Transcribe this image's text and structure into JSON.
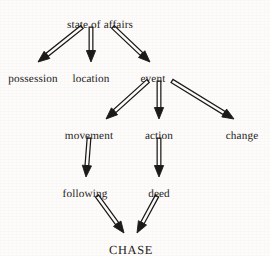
{
  "figure": {
    "type": "hierarchical-taxonomy-tree",
    "background_color": "#fdfcfb",
    "ink_color": "#1c1a18",
    "arrow_style": "outlined-double-stroke",
    "root": "state of affairs",
    "terminal": "CHASE"
  },
  "nodes": [
    {
      "id": "state-of-affairs",
      "label": "state of affairs",
      "x": 100,
      "y": 19,
      "level": 0
    },
    {
      "id": "possession",
      "label": "possession",
      "x": 33,
      "y": 73,
      "level": 1
    },
    {
      "id": "location",
      "label": "location",
      "x": 91,
      "y": 73,
      "level": 1
    },
    {
      "id": "event",
      "label": "event",
      "x": 153,
      "y": 73,
      "level": 1
    },
    {
      "id": "movement",
      "label": "movement",
      "x": 89,
      "y": 130,
      "level": 2
    },
    {
      "id": "action",
      "label": "action",
      "x": 159,
      "y": 130,
      "level": 2
    },
    {
      "id": "change",
      "label": "change",
      "x": 242,
      "y": 130,
      "level": 2
    },
    {
      "id": "following",
      "label": "following",
      "x": 85,
      "y": 188,
      "level": 3
    },
    {
      "id": "deed",
      "label": "deed",
      "x": 159,
      "y": 188,
      "level": 3
    },
    {
      "id": "chase",
      "label": "CHASE",
      "x": 131,
      "y": 244,
      "level": 4,
      "terminal": true
    }
  ],
  "edges": [
    {
      "id": "edge-soa-possession",
      "from": "state of affairs",
      "to": "possession",
      "x1": 82,
      "y1": 27,
      "x2": 38,
      "y2": 62
    },
    {
      "id": "edge-soa-location",
      "from": "state of affairs",
      "to": "location",
      "x1": 91,
      "y1": 27,
      "x2": 91,
      "y2": 62
    },
    {
      "id": "edge-soa-event",
      "from": "state of affairs",
      "to": "event",
      "x1": 113,
      "y1": 27,
      "x2": 150,
      "y2": 62
    },
    {
      "id": "edge-event-movement",
      "from": "event",
      "to": "movement",
      "x1": 148,
      "y1": 81,
      "x2": 106,
      "y2": 119
    },
    {
      "id": "edge-event-action",
      "from": "event",
      "to": "action",
      "x1": 159,
      "y1": 81,
      "x2": 159,
      "y2": 119
    },
    {
      "id": "edge-event-change",
      "from": "event",
      "to": "change",
      "x1": 172,
      "y1": 81,
      "x2": 234,
      "y2": 119
    },
    {
      "id": "edge-movement-following",
      "from": "movement",
      "to": "following",
      "x1": 89,
      "y1": 138,
      "x2": 86,
      "y2": 177
    },
    {
      "id": "edge-action-deed",
      "from": "action",
      "to": "deed",
      "x1": 159,
      "y1": 138,
      "x2": 159,
      "y2": 177
    },
    {
      "id": "edge-following-chase",
      "from": "following",
      "to": "CHASE",
      "x1": 97,
      "y1": 196,
      "x2": 124,
      "y2": 233
    },
    {
      "id": "edge-deed-chase",
      "from": "deed",
      "to": "CHASE",
      "x1": 157,
      "y1": 196,
      "x2": 137,
      "y2": 233
    }
  ],
  "chart_data": {
    "type": "tree",
    "title": "",
    "levels": [
      {
        "depth": 0,
        "labels": [
          "state of affairs"
        ]
      },
      {
        "depth": 1,
        "labels": [
          "possession",
          "location",
          "event"
        ]
      },
      {
        "depth": 2,
        "labels": [
          "movement",
          "action",
          "change"
        ]
      },
      {
        "depth": 3,
        "labels": [
          "following",
          "deed"
        ]
      },
      {
        "depth": 4,
        "labels": [
          "CHASE"
        ]
      }
    ],
    "relations": [
      [
        "state of affairs",
        "possession"
      ],
      [
        "state of affairs",
        "location"
      ],
      [
        "state of affairs",
        "event"
      ],
      [
        "event",
        "movement"
      ],
      [
        "event",
        "action"
      ],
      [
        "event",
        "change"
      ],
      [
        "movement",
        "following"
      ],
      [
        "action",
        "deed"
      ],
      [
        "following",
        "CHASE"
      ],
      [
        "deed",
        "CHASE"
      ]
    ]
  }
}
